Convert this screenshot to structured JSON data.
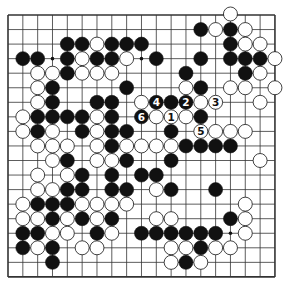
{
  "diagram": {
    "type": "go-board",
    "size": 19,
    "colors": {
      "black": "#111111",
      "white": "#ffffff",
      "line": "#333333",
      "background": "#ffffff"
    },
    "star_points": [
      [
        3,
        3
      ],
      [
        3,
        9
      ],
      [
        3,
        15
      ],
      [
        9,
        3
      ],
      [
        9,
        9
      ],
      [
        9,
        15
      ],
      [
        15,
        3
      ],
      [
        15,
        9
      ],
      [
        15,
        15
      ]
    ],
    "rows": [
      "...............W...",
      ".............BWBW..",
      "....BBWBBB.....BWW.",
      ".BB.BWBBW.B..B.BBBW",
      "..WWBWWW....B...BW.",
      "..WB....B...WB.WW.W",
      "..WB..BB.WBBBWW..W.",
      ".WBBBBWB.BWWWB.....",
      ".WBW.BWBB..B.WWWW..",
      "..WWW.WBWWWWBBBB...",
      "...WB.WWB..B.....W.",
      "..W.WB.B.BB........",
      "..WWBB.BB.WB..B....",
      ".WBBBWWWW.......W..",
      ".WWBWBWB..WW...BW..",
      ".BBWW.BW.BBBBBB.W..",
      ".BWB.WW....WWBWW...",
      "...B.......WBW.....",
      "..................."
    ],
    "numbered_moves": [
      {
        "label": "1",
        "row": 7,
        "col": 11,
        "color": "white"
      },
      {
        "label": "2",
        "row": 6,
        "col": 12,
        "color": "black"
      },
      {
        "label": "3",
        "row": 6,
        "col": 14,
        "color": "white"
      },
      {
        "label": "4",
        "row": 6,
        "col": 10,
        "color": "black"
      },
      {
        "label": "5",
        "row": 8,
        "col": 13,
        "color": "white"
      },
      {
        "label": "6",
        "row": 7,
        "col": 9,
        "color": "black"
      }
    ]
  }
}
